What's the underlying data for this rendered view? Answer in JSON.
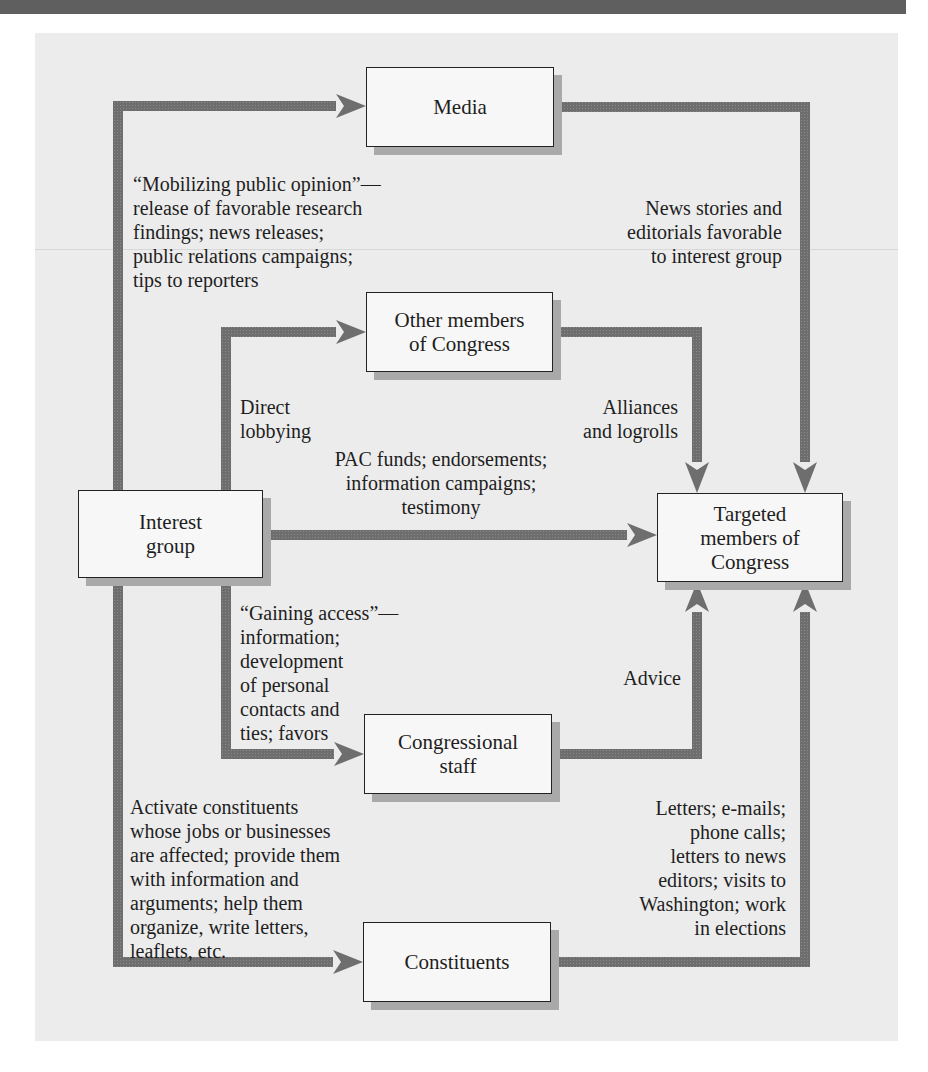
{
  "figure": {
    "header_bar_color": "#5f5f5f",
    "panel_color": "#ececec",
    "arrow_color": "#6e6e6e"
  },
  "nodes": {
    "media": "Media",
    "other_members": "Other members\nof Congress",
    "interest_group": "Interest\ngroup",
    "targeted_members": "Targeted\nmembers of\nCongress",
    "congressional_staff": "Congressional\nstaff",
    "constituents": "Constituents"
  },
  "edges": {
    "mobilizing_public_opinion": "“Mobilizing public opinion”—\nrelease of favorable research\nfindings; news releases;\npublic relations campaigns;\ntips to reporters",
    "news_stories": "News stories and\neditorials favorable\nto interest group",
    "direct_lobbying": "Direct\nlobbying",
    "alliances": "Alliances\nand logrolls",
    "pac_funds": "PAC funds; endorsements;\ninformation campaigns;\ntestimony",
    "gaining_access": "“Gaining access”—\ninformation;\ndevelopment\nof personal\ncontacts and\nties; favors",
    "advice": "Advice",
    "activate_constituents": "Activate constituents\nwhose jobs or businesses\nare affected; provide them\nwith information and\narguments; help them\norganize, write letters,\nleaflets, etc.",
    "letters": "Letters; e-mails;\nphone calls;\nletters to news\neditors; visits to\nWashington; work\nin elections"
  },
  "flows": [
    {
      "from": "Interest group",
      "to": "Media"
    },
    {
      "from": "Media",
      "to": "Targeted members of Congress"
    },
    {
      "from": "Interest group",
      "to": "Other members of Congress"
    },
    {
      "from": "Other members of Congress",
      "to": "Targeted members of Congress"
    },
    {
      "from": "Interest group",
      "to": "Targeted members of Congress"
    },
    {
      "from": "Interest group",
      "to": "Congressional staff"
    },
    {
      "from": "Congressional staff",
      "to": "Targeted members of Congress"
    },
    {
      "from": "Interest group",
      "to": "Constituents"
    },
    {
      "from": "Constituents",
      "to": "Targeted members of Congress"
    }
  ]
}
